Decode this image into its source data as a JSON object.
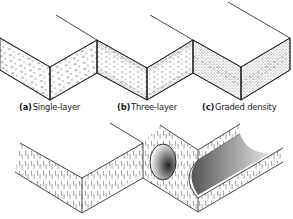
{
  "figure": {
    "panels": [
      {
        "id": "a",
        "letter": "(a)",
        "label": "Single-layer",
        "texture": "uniform-dash"
      },
      {
        "id": "b",
        "letter": "(b)",
        "label": "Three-layer",
        "texture": "dense-faces-coarse-core"
      },
      {
        "id": "c",
        "letter": "(c)",
        "label": "Graded density",
        "texture": "graded"
      }
    ],
    "bottom_panel": {
      "texture": "vertical-fibre-hatch",
      "features": [
        "round-hole",
        "half-round-groove"
      ],
      "label_visible": false
    },
    "colors": {
      "line": "#1a1a1a",
      "background": "#ffffff",
      "stipple": "#555555"
    }
  }
}
